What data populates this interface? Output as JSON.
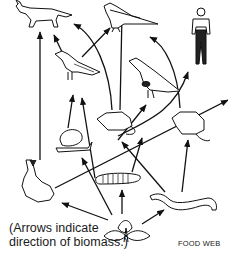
{
  "diagram": {
    "title": "FOOD WEB",
    "caption_line1": "(Arrows indicate",
    "caption_line2": "direction of biomass.)",
    "organisms": [
      {
        "id": "fox",
        "label": "fox"
      },
      {
        "id": "hawk",
        "label": "hawk"
      },
      {
        "id": "human",
        "label": "human"
      },
      {
        "id": "songbird",
        "label": "songbird"
      },
      {
        "id": "quail",
        "label": "quail"
      },
      {
        "id": "mouse",
        "label": "mouse"
      },
      {
        "id": "snail",
        "label": "snail"
      },
      {
        "id": "rat",
        "label": "rat"
      },
      {
        "id": "rabbit",
        "label": "rabbit"
      },
      {
        "id": "caterpillar",
        "label": "caterpillar"
      },
      {
        "id": "earthworm",
        "label": "earthworm"
      },
      {
        "id": "plant",
        "label": "plant"
      }
    ],
    "arrows": [
      {
        "from": "rabbit",
        "to": "fox"
      },
      {
        "from": "songbird",
        "to": "fox"
      },
      {
        "from": "mouse",
        "to": "fox"
      },
      {
        "from": "songbird",
        "to": "hawk"
      },
      {
        "from": "mouse",
        "to": "hawk"
      },
      {
        "from": "quail",
        "to": "hawk"
      },
      {
        "from": "rat",
        "to": "human"
      },
      {
        "from": "snail",
        "to": "songbird"
      },
      {
        "from": "caterpillar",
        "to": "songbird"
      },
      {
        "from": "mouse",
        "to": "quail"
      },
      {
        "from": "rabbit",
        "to": "quail"
      },
      {
        "from": "plant",
        "to": "snail"
      },
      {
        "from": "plant",
        "to": "mouse"
      },
      {
        "from": "earthworm",
        "to": "mouse"
      },
      {
        "from": "earthworm",
        "to": "rat"
      },
      {
        "from": "plant",
        "to": "rabbit"
      },
      {
        "from": "plant",
        "to": "caterpillar"
      },
      {
        "from": "plant",
        "to": "earthworm"
      }
    ]
  }
}
